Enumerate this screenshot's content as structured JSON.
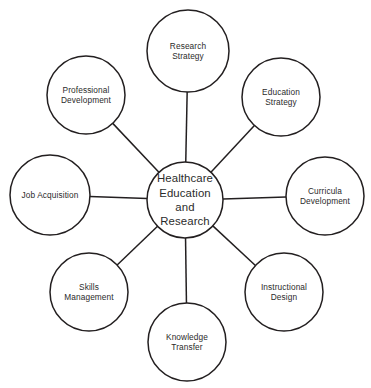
{
  "diagram": {
    "type": "radial-hub-and-spoke",
    "title": "Healthcare Education and Research",
    "background_color": "#ffffff",
    "stroke_color": "#231f20",
    "text_color": "#2b2b2b",
    "stroke_width": 1.5,
    "canvas": {
      "width": 371,
      "height": 388
    },
    "center_node": {
      "id": "healthcare-education-and-research",
      "label": "Healthcare\nEducation\nand\nResearch",
      "cx": 185,
      "cy": 200,
      "r": 38
    },
    "satellite_nodes": [
      {
        "id": "research-strategy",
        "label": "Research\nStrategy",
        "cx": 188,
        "cy": 51,
        "r": 41,
        "angle_deg": 90
      },
      {
        "id": "education-strategy",
        "label": "Education\nStrategy",
        "cx": 281,
        "cy": 97,
        "r": 39,
        "angle_deg": 45
      },
      {
        "id": "curricula-development",
        "label": "Curricula\nDevelopment",
        "cx": 325,
        "cy": 196,
        "r": 39,
        "angle_deg": 0
      },
      {
        "id": "instructional-design",
        "label": "Instructional\nDesign",
        "cx": 284,
        "cy": 292,
        "r": 39,
        "angle_deg": -45
      },
      {
        "id": "knowledge-transfer",
        "label": "Knowledge\nTransfer",
        "cx": 187,
        "cy": 342,
        "r": 39,
        "angle_deg": -90
      },
      {
        "id": "skills-management",
        "label": "Skills\nManagement",
        "cx": 89,
        "cy": 292,
        "r": 39,
        "angle_deg": -135
      },
      {
        "id": "job-acquisition",
        "label": "Job Acquisition",
        "cx": 50,
        "cy": 195,
        "r": 40,
        "angle_deg": 180
      },
      {
        "id": "professional-development",
        "label": "Professional\nDevelopment",
        "cx": 86,
        "cy": 95,
        "r": 39,
        "angle_deg": 135
      }
    ],
    "connectors": [
      {
        "id": "connector-research-strategy",
        "from": "healthcare-education-and-research",
        "to": "research-strategy"
      },
      {
        "id": "connector-education-strategy",
        "from": "healthcare-education-and-research",
        "to": "education-strategy"
      },
      {
        "id": "connector-curricula-development",
        "from": "healthcare-education-and-research",
        "to": "curricula-development"
      },
      {
        "id": "connector-instructional-design",
        "from": "healthcare-education-and-research",
        "to": "instructional-design"
      },
      {
        "id": "connector-knowledge-transfer",
        "from": "healthcare-education-and-research",
        "to": "knowledge-transfer"
      },
      {
        "id": "connector-skills-management",
        "from": "healthcare-education-and-research",
        "to": "skills-management"
      },
      {
        "id": "connector-job-acquisition",
        "from": "healthcare-education-and-research",
        "to": "job-acquisition"
      },
      {
        "id": "connector-professional-development",
        "from": "healthcare-education-and-research",
        "to": "professional-development"
      }
    ]
  }
}
